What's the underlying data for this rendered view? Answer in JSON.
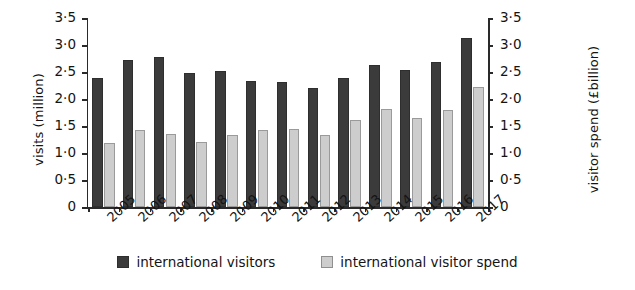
{
  "chart_data": {
    "type": "bar",
    "title": "",
    "subtitle": "",
    "xlabel": "",
    "ylabel": "visits (million)",
    "y2label": "visitor spend (£billion)",
    "ylim": [
      0,
      3.5
    ],
    "y2lim": [
      0,
      3.5
    ],
    "grid": false,
    "legend_position": "bottom-center",
    "ytick_labels": [
      "3·5",
      "3·0",
      "2·5",
      "2·0",
      "1·5",
      "1·0",
      "0·5",
      "0"
    ],
    "ytick_values": [
      3.5,
      3.0,
      2.5,
      2.0,
      1.5,
      1.0,
      0.5,
      0
    ],
    "y2tick_labels": [
      "3·5",
      "3·0",
      "2·5",
      "2·0",
      "1·5",
      "1·0",
      "0·5",
      "0"
    ],
    "y2tick_values": [
      3.5,
      3.0,
      2.5,
      2.0,
      1.5,
      1.0,
      0.5,
      0
    ],
    "categories": [
      "2005",
      "2006",
      "2007",
      "2008",
      "2009",
      "2010",
      "2011",
      "2012",
      "2013",
      "2014",
      "2015",
      "2016",
      "2017"
    ],
    "series": [
      {
        "name": "international visitors",
        "axis": "left",
        "unit": "million",
        "color": "#3b3b3b",
        "values": [
          2.38,
          2.72,
          2.77,
          2.48,
          2.52,
          2.33,
          2.31,
          2.2,
          2.38,
          2.63,
          2.54,
          2.68,
          3.13
        ]
      },
      {
        "name": "international visitor spend",
        "axis": "right",
        "unit": "£billion",
        "color": "#cdcdcd",
        "values": [
          1.19,
          1.42,
          1.35,
          1.21,
          1.33,
          1.42,
          1.45,
          1.33,
          1.62,
          1.81,
          1.64,
          1.8,
          2.22
        ]
      }
    ]
  },
  "legend": {
    "items": [
      {
        "label": "international visitors",
        "color": "#3b3b3b"
      },
      {
        "label": "international visitor spend",
        "color": "#cdcdcd"
      }
    ]
  },
  "colors": {
    "visitors": "#3b3b3b",
    "spend": "#cdcdcd",
    "axis": "#2a2a2a",
    "background": "#ffffff",
    "text": "#141414"
  }
}
